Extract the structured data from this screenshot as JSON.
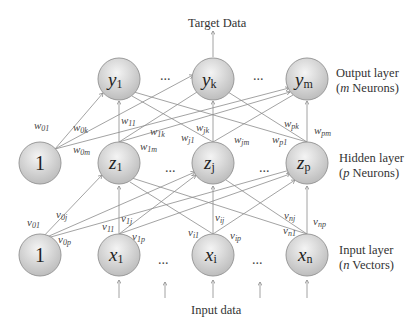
{
  "title_top": "Target Data",
  "title_bottom": "Input data",
  "layers": {
    "output": {
      "name": "Output layer",
      "desc_var": "m",
      "desc_rest": " Neurons)"
    },
    "hidden": {
      "name": "Hidden layer",
      "desc_var": "p",
      "desc_rest": " Neurons)"
    },
    "input": {
      "name": "Input layer",
      "desc_var": "n",
      "desc_rest": " Vectors)"
    }
  },
  "nodes": {
    "output": [
      {
        "var": "y",
        "sub": "1"
      },
      {
        "var": "y",
        "sub": "k"
      },
      {
        "var": "y",
        "sub": "m"
      }
    ],
    "hidden_bias": "1",
    "hidden": [
      {
        "var": "z",
        "sub": "1"
      },
      {
        "var": "z",
        "sub": "j"
      },
      {
        "var": "z",
        "sub": "p"
      }
    ],
    "input_bias": "1",
    "input": [
      {
        "var": "x",
        "sub": "1"
      },
      {
        "var": "x",
        "sub": "i"
      },
      {
        "var": "x",
        "sub": "n"
      }
    ]
  },
  "ellipsis": "...",
  "weights_w": [
    "w01",
    "w0k",
    "w0m",
    "w11",
    "w1k",
    "w1m",
    "wjk",
    "wj1",
    "wjm",
    "wpk",
    "wp1",
    "wpm"
  ],
  "weights_v": [
    "v01",
    "v0j",
    "v0p",
    "v11",
    "v1j",
    "v1p",
    "vi1",
    "vij",
    "vip",
    "vn1",
    "vnj",
    "vnp"
  ],
  "colors": {
    "node_fill_light": "#f2f2f2",
    "node_fill_dark": "#bdbdbd",
    "node_stroke": "#9a9a9a",
    "edge": "#8a8a8a"
  }
}
